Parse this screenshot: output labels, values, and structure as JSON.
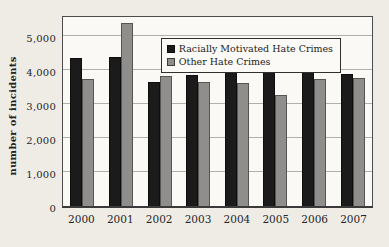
{
  "figure": {
    "ylabel": "number of incidents"
  },
  "chart_data": {
    "type": "bar",
    "title": "",
    "xlabel": "",
    "ylabel": "number of incidents",
    "categories": [
      "2000",
      "2001",
      "2002",
      "2003",
      "2004",
      "2005",
      "2006",
      "2007"
    ],
    "series": [
      {
        "name": "Racially Motivated Hate Crimes",
        "color": "#1b1b1b",
        "values": [
          4350,
          4370,
          3640,
          3840,
          4040,
          3920,
          4000,
          3870
        ]
      },
      {
        "name": "Other Hate Crimes",
        "color": "#8f8e8c",
        "values": [
          3730,
          5360,
          3820,
          3650,
          3610,
          3250,
          3720,
          3750
        ]
      }
    ],
    "ylim": [
      0,
      5575
    ],
    "y_tick_values": [
      0,
      1000,
      2000,
      3000,
      4000,
      5000
    ],
    "y_tick_labels": [
      "0",
      "1,000",
      "2,000",
      "3,000",
      "4,000",
      "5,000"
    ],
    "grid": true,
    "legend_position": "top-right"
  },
  "colors": {
    "page_bg": "#efece6",
    "plot_bg": "#faf9f5",
    "gridline": "#b2b0ab",
    "black_bar": "#1b1b1b",
    "gray_bar": "#8f8e8c",
    "plot_border": "#4d4d4d"
  }
}
